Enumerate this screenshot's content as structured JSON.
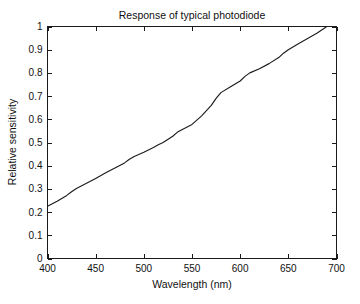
{
  "figure": {
    "background_color": "#ffffff",
    "axes_color": "#1a1a1a",
    "line_color": "#1c1c1c"
  },
  "chart_data": {
    "type": "line",
    "title": "Response of typical photodiode",
    "xlabel": "Wavelength (nm)",
    "ylabel": "Relative sensitivity",
    "xlim": [
      400,
      700
    ],
    "ylim": [
      0,
      1
    ],
    "grid": false,
    "legend": null,
    "xticks": [
      400,
      450,
      500,
      550,
      600,
      650,
      700
    ],
    "xtick_labels": [
      "400",
      "450",
      "500",
      "550",
      "600",
      "650",
      "700"
    ],
    "yticks": [
      0,
      0.1,
      0.2,
      0.3,
      0.4,
      0.5,
      0.6,
      0.7,
      0.8,
      0.9,
      1
    ],
    "ytick_labels": [
      "0",
      "0.1",
      "0.2",
      "0.3",
      "0.4",
      "0.5",
      "0.6",
      "0.7",
      "0.8",
      "0.9",
      "1"
    ],
    "box": true,
    "tick_direction": "in",
    "series": [
      {
        "name": "Relative sensitivity",
        "color": "#1c1c1c",
        "x": [
          400,
          410,
          420,
          425,
          430,
          440,
          450,
          460,
          470,
          480,
          485,
          490,
          500,
          510,
          515,
          520,
          530,
          535,
          540,
          550,
          560,
          570,
          575,
          580,
          590,
          600,
          605,
          610,
          620,
          630,
          640,
          645,
          650,
          660,
          670,
          680,
          690,
          700
        ],
        "y": [
          0.225,
          0.247,
          0.272,
          0.288,
          0.302,
          0.323,
          0.345,
          0.368,
          0.39,
          0.412,
          0.428,
          0.44,
          0.458,
          0.478,
          0.49,
          0.5,
          0.527,
          0.545,
          0.556,
          0.578,
          0.615,
          0.66,
          0.69,
          0.715,
          0.74,
          0.765,
          0.785,
          0.8,
          0.818,
          0.84,
          0.866,
          0.885,
          0.9,
          0.925,
          0.948,
          0.972,
          1.0,
          1.0
        ]
      }
    ]
  }
}
